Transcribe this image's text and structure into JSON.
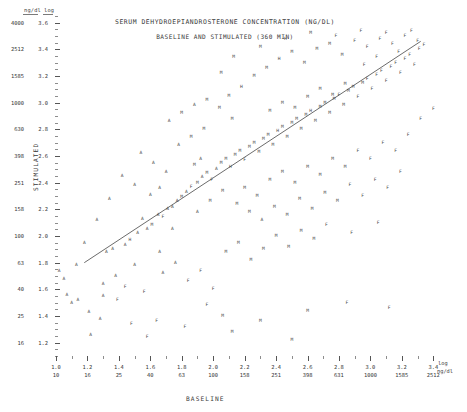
{
  "figure": {
    "title": "SERUM DEHYDROEPIANDROSTERONE CONCENTRATION (NG/DL)",
    "subtitle": "BASELINE AND STIMULATED (360 MIN)",
    "corner_header_raw": "ng/dl",
    "corner_header_log": "log",
    "right_header_log": "log",
    "right_header_raw": "ng/dl"
  },
  "chart_data": {
    "type": "scatter",
    "title": "SERUM DEHYDROEPIANDROSTERONE CONCENTRATION (NG/DL)",
    "subtitle": "BASELINE AND STIMULATED (360 MIN)",
    "xlabel": "BASELINE",
    "ylabel": "STIMULATED",
    "grid": false,
    "legend": "none",
    "axis_scale": "log10",
    "xlim_log": [
      1.0,
      3.5
    ],
    "ylim_log": [
      1.1,
      3.65
    ],
    "x_ticks_log": [
      1.0,
      1.2,
      1.4,
      1.6,
      1.8,
      2.0,
      2.2,
      2.4,
      2.6,
      2.8,
      3.0,
      3.2,
      3.4
    ],
    "x_ticks_raw": [
      10,
      16,
      25,
      40,
      63,
      100,
      158,
      251,
      398,
      631,
      1000,
      1585,
      2512
    ],
    "y_ticks_log": [
      3.6,
      3.4,
      3.2,
      3.0,
      2.8,
      2.6,
      2.4,
      2.2,
      2.0,
      1.8,
      1.6,
      1.4,
      1.2
    ],
    "y_ticks_raw": [
      4000,
      2512,
      1585,
      1000,
      630,
      398,
      251,
      158,
      100,
      63,
      40,
      25,
      16
    ],
    "marker_style": "letter-codes",
    "fit_line": {
      "x_log": [
        1.18,
        3.32
      ],
      "y_log": [
        1.8,
        3.46
      ]
    },
    "points": [
      {
        "x": 1.07,
        "y": 1.56,
        "m": "A"
      },
      {
        "x": 1.1,
        "y": 1.5,
        "m": "A"
      },
      {
        "x": 1.14,
        "y": 1.52,
        "m": "A"
      },
      {
        "x": 1.3,
        "y": 1.55,
        "m": "A"
      },
      {
        "x": 1.39,
        "y": 1.52,
        "m": "F"
      },
      {
        "x": 1.21,
        "y": 1.43,
        "m": "A"
      },
      {
        "x": 1.32,
        "y": 1.88,
        "m": "A"
      },
      {
        "x": 1.36,
        "y": 1.9,
        "m": "A"
      },
      {
        "x": 1.44,
        "y": 1.93,
        "m": "A"
      },
      {
        "x": 1.47,
        "y": 1.97,
        "m": "H"
      },
      {
        "x": 1.52,
        "y": 2.02,
        "m": "A"
      },
      {
        "x": 1.58,
        "y": 2.05,
        "m": "A"
      },
      {
        "x": 1.61,
        "y": 2.08,
        "m": "M"
      },
      {
        "x": 1.55,
        "y": 2.13,
        "m": "A"
      },
      {
        "x": 1.65,
        "y": 2.16,
        "m": "A"
      },
      {
        "x": 1.68,
        "y": 2.14,
        "m": "F"
      },
      {
        "x": 1.71,
        "y": 2.2,
        "m": "A"
      },
      {
        "x": 1.74,
        "y": 2.22,
        "m": "A"
      },
      {
        "x": 1.6,
        "y": 2.31,
        "m": "A"
      },
      {
        "x": 1.66,
        "y": 2.36,
        "m": "A"
      },
      {
        "x": 1.77,
        "y": 2.26,
        "m": "A"
      },
      {
        "x": 1.8,
        "y": 2.29,
        "m": "M"
      },
      {
        "x": 1.83,
        "y": 2.33,
        "m": "A"
      },
      {
        "x": 1.86,
        "y": 2.37,
        "m": "F"
      },
      {
        "x": 1.9,
        "y": 2.4,
        "m": "M"
      },
      {
        "x": 1.93,
        "y": 2.44,
        "m": "A"
      },
      {
        "x": 1.96,
        "y": 2.47,
        "m": "M"
      },
      {
        "x": 1.99,
        "y": 2.42,
        "m": "F"
      },
      {
        "x": 1.88,
        "y": 2.53,
        "m": "M"
      },
      {
        "x": 1.92,
        "y": 2.58,
        "m": "A"
      },
      {
        "x": 2.02,
        "y": 2.5,
        "m": "A"
      },
      {
        "x": 2.05,
        "y": 2.55,
        "m": "M"
      },
      {
        "x": 2.08,
        "y": 2.58,
        "m": "M"
      },
      {
        "x": 2.11,
        "y": 2.52,
        "m": "H"
      },
      {
        "x": 2.14,
        "y": 2.61,
        "m": "M"
      },
      {
        "x": 2.17,
        "y": 2.64,
        "m": "M"
      },
      {
        "x": 2.2,
        "y": 2.57,
        "m": "F"
      },
      {
        "x": 2.23,
        "y": 2.67,
        "m": "M"
      },
      {
        "x": 2.26,
        "y": 2.7,
        "m": "M"
      },
      {
        "x": 2.29,
        "y": 2.63,
        "m": "M"
      },
      {
        "x": 2.32,
        "y": 2.73,
        "m": "M"
      },
      {
        "x": 2.35,
        "y": 2.76,
        "m": "M"
      },
      {
        "x": 2.38,
        "y": 2.68,
        "m": "M"
      },
      {
        "x": 2.41,
        "y": 2.79,
        "m": "H"
      },
      {
        "x": 2.44,
        "y": 2.82,
        "m": "M"
      },
      {
        "x": 2.47,
        "y": 2.74,
        "m": "M"
      },
      {
        "x": 2.5,
        "y": 2.85,
        "m": "M"
      },
      {
        "x": 2.53,
        "y": 2.88,
        "m": "M"
      },
      {
        "x": 2.56,
        "y": 2.8,
        "m": "M"
      },
      {
        "x": 2.59,
        "y": 2.91,
        "m": "M"
      },
      {
        "x": 2.62,
        "y": 2.94,
        "m": "H"
      },
      {
        "x": 2.65,
        "y": 2.86,
        "m": "M"
      },
      {
        "x": 2.68,
        "y": 2.97,
        "m": "M"
      },
      {
        "x": 2.71,
        "y": 3.0,
        "m": "M"
      },
      {
        "x": 2.74,
        "y": 2.92,
        "m": "M"
      },
      {
        "x": 2.77,
        "y": 3.03,
        "m": "M"
      },
      {
        "x": 2.8,
        "y": 3.06,
        "m": "F"
      },
      {
        "x": 2.83,
        "y": 2.98,
        "m": "M"
      },
      {
        "x": 2.86,
        "y": 3.09,
        "m": "M"
      },
      {
        "x": 2.89,
        "y": 3.12,
        "m": "M"
      },
      {
        "x": 2.92,
        "y": 3.04,
        "m": "F"
      },
      {
        "x": 2.95,
        "y": 3.15,
        "m": "M"
      },
      {
        "x": 2.98,
        "y": 3.18,
        "m": "F"
      },
      {
        "x": 3.01,
        "y": 3.1,
        "m": "F"
      },
      {
        "x": 3.04,
        "y": 3.21,
        "m": "F"
      },
      {
        "x": 3.07,
        "y": 3.24,
        "m": "F"
      },
      {
        "x": 3.1,
        "y": 3.16,
        "m": "F"
      },
      {
        "x": 3.13,
        "y": 3.27,
        "m": "F"
      },
      {
        "x": 3.16,
        "y": 3.3,
        "m": "F"
      },
      {
        "x": 3.19,
        "y": 3.22,
        "m": "F"
      },
      {
        "x": 3.22,
        "y": 3.33,
        "m": "F"
      },
      {
        "x": 3.25,
        "y": 3.36,
        "m": "F"
      },
      {
        "x": 3.28,
        "y": 3.28,
        "m": "F"
      },
      {
        "x": 3.31,
        "y": 3.4,
        "m": "F"
      },
      {
        "x": 3.34,
        "y": 3.43,
        "m": "F"
      },
      {
        "x": 2.1,
        "y": 3.05,
        "m": "M"
      },
      {
        "x": 2.18,
        "y": 3.12,
        "m": "H"
      },
      {
        "x": 2.26,
        "y": 3.2,
        "m": "M"
      },
      {
        "x": 2.34,
        "y": 3.26,
        "m": "M"
      },
      {
        "x": 2.42,
        "y": 3.33,
        "m": "H"
      },
      {
        "x": 2.5,
        "y": 3.38,
        "m": "M"
      },
      {
        "x": 2.58,
        "y": 3.3,
        "m": "M"
      },
      {
        "x": 2.66,
        "y": 3.4,
        "m": "M"
      },
      {
        "x": 2.74,
        "y": 3.44,
        "m": "M"
      },
      {
        "x": 2.82,
        "y": 3.36,
        "m": "M"
      },
      {
        "x": 2.9,
        "y": 3.46,
        "m": "F"
      },
      {
        "x": 2.98,
        "y": 3.42,
        "m": "F"
      },
      {
        "x": 3.06,
        "y": 3.48,
        "m": "F"
      },
      {
        "x": 3.14,
        "y": 3.44,
        "m": "F"
      },
      {
        "x": 3.22,
        "y": 3.5,
        "m": "F"
      },
      {
        "x": 3.3,
        "y": 3.46,
        "m": "F"
      },
      {
        "x": 2.05,
        "y": 3.22,
        "m": "M"
      },
      {
        "x": 2.13,
        "y": 3.34,
        "m": "M"
      },
      {
        "x": 2.3,
        "y": 3.42,
        "m": "M"
      },
      {
        "x": 2.46,
        "y": 3.48,
        "m": "H"
      },
      {
        "x": 2.62,
        "y": 3.52,
        "m": "M"
      },
      {
        "x": 2.78,
        "y": 3.5,
        "m": "F"
      },
      {
        "x": 2.94,
        "y": 3.54,
        "m": "F"
      },
      {
        "x": 3.1,
        "y": 3.52,
        "m": "F"
      },
      {
        "x": 3.26,
        "y": 3.54,
        "m": "F"
      },
      {
        "x": 1.54,
        "y": 2.62,
        "m": "A"
      },
      {
        "x": 1.62,
        "y": 2.55,
        "m": "A"
      },
      {
        "x": 1.7,
        "y": 2.48,
        "m": "A"
      },
      {
        "x": 1.78,
        "y": 2.68,
        "m": "A"
      },
      {
        "x": 1.86,
        "y": 2.74,
        "m": "M"
      },
      {
        "x": 1.94,
        "y": 2.8,
        "m": "M"
      },
      {
        "x": 1.72,
        "y": 2.86,
        "m": "A"
      },
      {
        "x": 1.8,
        "y": 2.92,
        "m": "M"
      },
      {
        "x": 1.88,
        "y": 2.98,
        "m": "A"
      },
      {
        "x": 1.96,
        "y": 3.02,
        "m": "M"
      },
      {
        "x": 2.2,
        "y": 2.36,
        "m": "M"
      },
      {
        "x": 2.28,
        "y": 2.3,
        "m": "M"
      },
      {
        "x": 2.36,
        "y": 2.42,
        "m": "M"
      },
      {
        "x": 2.44,
        "y": 2.48,
        "m": "M"
      },
      {
        "x": 2.52,
        "y": 2.4,
        "m": "M"
      },
      {
        "x": 2.6,
        "y": 2.52,
        "m": "M"
      },
      {
        "x": 2.68,
        "y": 2.46,
        "m": "M"
      },
      {
        "x": 2.76,
        "y": 2.58,
        "m": "M"
      },
      {
        "x": 2.84,
        "y": 2.52,
        "m": "M"
      },
      {
        "x": 2.92,
        "y": 2.64,
        "m": "F"
      },
      {
        "x": 3.0,
        "y": 2.58,
        "m": "F"
      },
      {
        "x": 3.08,
        "y": 2.7,
        "m": "F"
      },
      {
        "x": 3.16,
        "y": 2.64,
        "m": "F"
      },
      {
        "x": 3.24,
        "y": 2.76,
        "m": "F"
      },
      {
        "x": 3.32,
        "y": 2.88,
        "m": "F"
      },
      {
        "x": 3.4,
        "y": 2.95,
        "m": "F"
      },
      {
        "x": 2.15,
        "y": 2.24,
        "m": "M"
      },
      {
        "x": 2.23,
        "y": 2.18,
        "m": "M"
      },
      {
        "x": 2.31,
        "y": 2.12,
        "m": "A"
      },
      {
        "x": 2.39,
        "y": 2.22,
        "m": "M"
      },
      {
        "x": 2.47,
        "y": 2.16,
        "m": "M"
      },
      {
        "x": 2.55,
        "y": 2.28,
        "m": "M"
      },
      {
        "x": 2.63,
        "y": 2.2,
        "m": "M"
      },
      {
        "x": 2.71,
        "y": 2.32,
        "m": "M"
      },
      {
        "x": 2.79,
        "y": 2.26,
        "m": "M"
      },
      {
        "x": 2.87,
        "y": 2.38,
        "m": "F"
      },
      {
        "x": 2.95,
        "y": 2.3,
        "m": "F"
      },
      {
        "x": 3.03,
        "y": 2.42,
        "m": "F"
      },
      {
        "x": 3.11,
        "y": 2.36,
        "m": "F"
      },
      {
        "x": 3.19,
        "y": 2.48,
        "m": "F"
      },
      {
        "x": 1.42,
        "y": 2.45,
        "m": "A"
      },
      {
        "x": 1.5,
        "y": 2.38,
        "m": "A"
      },
      {
        "x": 1.34,
        "y": 2.28,
        "m": "A"
      },
      {
        "x": 1.26,
        "y": 2.12,
        "m": "A"
      },
      {
        "x": 1.18,
        "y": 1.95,
        "m": "A"
      },
      {
        "x": 1.13,
        "y": 1.78,
        "m": "A"
      },
      {
        "x": 1.05,
        "y": 1.68,
        "m": "A"
      },
      {
        "x": 1.02,
        "y": 1.74,
        "m": "A"
      },
      {
        "x": 1.44,
        "y": 1.62,
        "m": "F"
      },
      {
        "x": 1.56,
        "y": 1.58,
        "m": "F"
      },
      {
        "x": 1.68,
        "y": 1.72,
        "m": "A"
      },
      {
        "x": 1.76,
        "y": 1.8,
        "m": "A"
      },
      {
        "x": 1.84,
        "y": 1.66,
        "m": "F"
      },
      {
        "x": 1.92,
        "y": 1.74,
        "m": "F"
      },
      {
        "x": 2.0,
        "y": 1.6,
        "m": "F"
      },
      {
        "x": 2.08,
        "y": 1.88,
        "m": "M"
      },
      {
        "x": 2.16,
        "y": 1.95,
        "m": "M"
      },
      {
        "x": 2.24,
        "y": 1.82,
        "m": "M"
      },
      {
        "x": 2.32,
        "y": 1.9,
        "m": "M"
      },
      {
        "x": 2.4,
        "y": 2.0,
        "m": "M"
      },
      {
        "x": 2.48,
        "y": 1.92,
        "m": "M"
      },
      {
        "x": 2.56,
        "y": 2.04,
        "m": "M"
      },
      {
        "x": 2.64,
        "y": 1.98,
        "m": "M"
      },
      {
        "x": 2.72,
        "y": 2.08,
        "m": "F"
      },
      {
        "x": 2.88,
        "y": 2.02,
        "m": "F"
      },
      {
        "x": 3.05,
        "y": 2.1,
        "m": "F"
      },
      {
        "x": 1.28,
        "y": 1.38,
        "m": "A"
      },
      {
        "x": 1.48,
        "y": 1.34,
        "m": "F"
      },
      {
        "x": 1.64,
        "y": 1.36,
        "m": "F"
      },
      {
        "x": 1.82,
        "y": 1.32,
        "m": "F"
      },
      {
        "x": 2.06,
        "y": 1.4,
        "m": "M"
      },
      {
        "x": 2.3,
        "y": 1.36,
        "m": "M"
      },
      {
        "x": 1.22,
        "y": 1.26,
        "m": "A"
      },
      {
        "x": 1.58,
        "y": 1.24,
        "m": "F"
      },
      {
        "x": 2.12,
        "y": 1.28,
        "m": "M"
      },
      {
        "x": 2.5,
        "y": 1.22,
        "m": "M"
      },
      {
        "x": 1.96,
        "y": 1.48,
        "m": "F"
      },
      {
        "x": 2.6,
        "y": 1.44,
        "m": "M"
      },
      {
        "x": 2.85,
        "y": 1.5,
        "m": "F"
      },
      {
        "x": 3.12,
        "y": 1.46,
        "m": "F"
      },
      {
        "x": 2.04,
        "y": 2.96,
        "m": "M"
      },
      {
        "x": 2.12,
        "y": 2.88,
        "m": "M"
      },
      {
        "x": 2.36,
        "y": 2.94,
        "m": "M"
      },
      {
        "x": 2.44,
        "y": 3.0,
        "m": "M"
      },
      {
        "x": 2.52,
        "y": 2.96,
        "m": "M"
      },
      {
        "x": 2.6,
        "y": 3.04,
        "m": "M"
      },
      {
        "x": 2.68,
        "y": 3.1,
        "m": "M"
      },
      {
        "x": 2.76,
        "y": 3.06,
        "m": "M"
      },
      {
        "x": 2.84,
        "y": 3.14,
        "m": "M"
      },
      {
        "x": 2.96,
        "y": 3.28,
        "m": "F"
      },
      {
        "x": 3.04,
        "y": 3.34,
        "m": "F"
      },
      {
        "x": 3.18,
        "y": 3.38,
        "m": "F"
      },
      {
        "x": 1.9,
        "y": 2.18,
        "m": "A"
      },
      {
        "x": 1.98,
        "y": 2.26,
        "m": "M"
      },
      {
        "x": 2.06,
        "y": 2.34,
        "m": "M"
      },
      {
        "x": 1.74,
        "y": 2.05,
        "m": "A"
      },
      {
        "x": 1.66,
        "y": 1.88,
        "m": "A"
      },
      {
        "x": 1.5,
        "y": 1.78,
        "m": "A"
      },
      {
        "x": 1.38,
        "y": 1.7,
        "m": "A"
      },
      {
        "x": 1.3,
        "y": 1.64,
        "m": "A"
      }
    ]
  },
  "axes": {
    "x_title": "BASELINE",
    "y_title": "STIMULATED"
  }
}
